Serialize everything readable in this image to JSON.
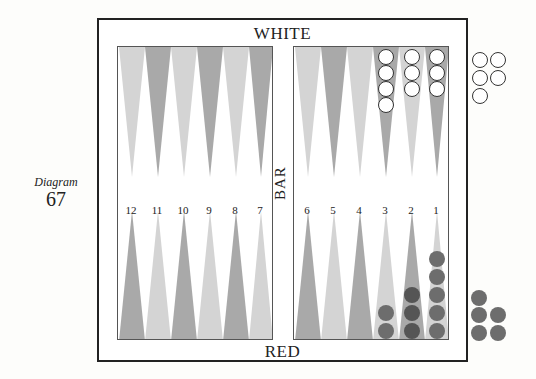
{
  "caption": {
    "title": "Diagram",
    "number": "67"
  },
  "labels": {
    "top": "WHITE",
    "bottom": "RED",
    "bar": "BAR"
  },
  "point_numbers": {
    "left": [
      "12",
      "11",
      "10",
      "9",
      "8",
      "7"
    ],
    "right": [
      "6",
      "5",
      "4",
      "3",
      "2",
      "1"
    ]
  },
  "colors": {
    "light_point": "#d4d4d4",
    "dark_point": "#a9a9a9",
    "red_checker": "#6d6d6d",
    "red_checker_dark": "#555555",
    "white_checker": "#ffffff"
  },
  "position": {
    "white": {
      "point_3": 4,
      "point_2": 3,
      "point_1": 3,
      "borne_off": 5
    },
    "red": {
      "point_3": 2,
      "point_2": 3,
      "point_1": 5,
      "borne_off": 5
    }
  }
}
